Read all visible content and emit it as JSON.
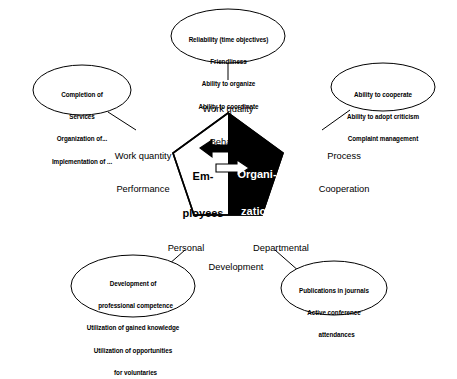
{
  "diagram": {
    "colors": {
      "ink": "#000000",
      "paper": "#ffffff"
    },
    "center": {
      "left_label_line1": "Em-",
      "left_label_line2": "ployees",
      "right_label_line1": "Organi-",
      "right_label_line2": "zation",
      "arrow_left_name": "arrow-pointing-left",
      "arrow_right_name": "arrow-pointing-right"
    },
    "axes": [
      {
        "id": "work-quality",
        "line1": "Work quality",
        "line2": "Behavior"
      },
      {
        "id": "work-quantity",
        "line1": "Work quantity",
        "line2": "Performance"
      },
      {
        "id": "process",
        "line1": "Process",
        "line2": "Cooperation"
      },
      {
        "id": "personal-development",
        "line1": "Personal",
        "line2": "Development"
      },
      {
        "id": "departmental-development",
        "line1": "Departmental",
        "line2": ""
      }
    ],
    "notes": [
      {
        "id": "note-work-quality",
        "lines": [
          "Reliability (time objectives)",
          "Friendliness",
          "Ability to organize",
          "Ability to coordinate"
        ]
      },
      {
        "id": "note-work-quantity",
        "lines": [
          "Completion of",
          "Services",
          "Organization of...",
          "Implementation of ..."
        ]
      },
      {
        "id": "note-process-cooperation",
        "lines": [
          "Ability to cooperate",
          "Ability to adopt criticism",
          "Complaint management"
        ]
      },
      {
        "id": "note-personal-development",
        "lines": [
          "Development of",
          "   professional competence",
          "Utilization of gained knowledge",
          "Utilization of opportunities",
          "   for voluntaries"
        ]
      },
      {
        "id": "note-departmental-development",
        "lines": [
          "Publications in journals",
          "Active conference",
          "   attendances"
        ]
      }
    ]
  }
}
